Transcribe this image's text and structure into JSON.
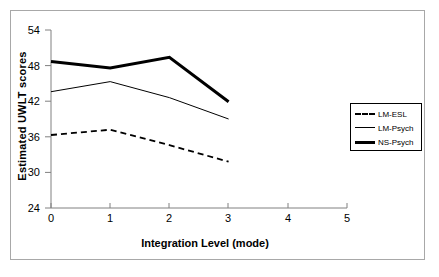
{
  "chart_data": {
    "type": "line",
    "title": "",
    "xlabel": "Integration Level (mode)",
    "ylabel": "Estimated UWLT scores",
    "xlim": [
      0,
      5
    ],
    "ylim": [
      24,
      54
    ],
    "xticks": [
      "0",
      "1",
      "2",
      "3",
      "4",
      "5"
    ],
    "yticks": [
      "24",
      "30",
      "36",
      "42",
      "48",
      "54"
    ],
    "grid": false,
    "legend_position": "right",
    "x": [
      0,
      1,
      2,
      3
    ],
    "series": [
      {
        "name": "LM-ESL",
        "style": "dashed",
        "values": [
          36.3,
          37.2,
          34.6,
          31.8
        ]
      },
      {
        "name": "LM-Psych",
        "style": "thin-solid",
        "values": [
          43.6,
          45.3,
          42.6,
          39.0
        ]
      },
      {
        "name": "NS-Psych",
        "style": "thick-solid",
        "values": [
          48.7,
          47.6,
          49.4,
          41.9
        ]
      }
    ]
  },
  "legend": {
    "items": [
      {
        "label": "LM-ESL"
      },
      {
        "label": "LM-Psych"
      },
      {
        "label": "NS-Psych"
      }
    ]
  },
  "colors": {
    "axis": "#808080",
    "line": "#000000",
    "frame": "#a8a8a8",
    "background": "#ffffff"
  }
}
